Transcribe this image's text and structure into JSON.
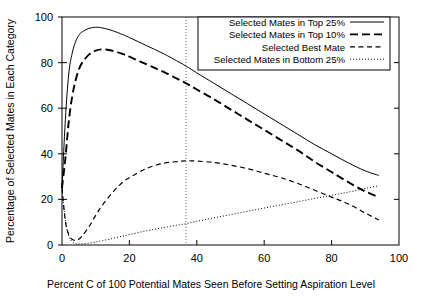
{
  "chart_data": {
    "type": "line",
    "title": "",
    "xlabel": "Percent C of 100 Potential Mates Seen Before Setting Aspiration Level",
    "ylabel": "Percentage of Selected Mates in Each Category",
    "xlim": [
      0,
      100
    ],
    "ylim": [
      0,
      100
    ],
    "xticks": [
      0,
      20,
      40,
      60,
      80,
      100
    ],
    "yticks": [
      0,
      20,
      40,
      60,
      80,
      100
    ],
    "xtick_labels": [
      "0",
      "20",
      "40",
      "60",
      "80",
      "100"
    ],
    "ytick_labels": [
      "0",
      "20",
      "40",
      "60",
      "80",
      "100"
    ],
    "grid": false,
    "legend_position": "top-right",
    "annotations": [
      {
        "name": "optimal-c-line",
        "type": "vline",
        "x": 37,
        "style": "dotted",
        "label": ""
      }
    ],
    "x": [
      0,
      1,
      2,
      3,
      4,
      5,
      6,
      8,
      10,
      12,
      15,
      18,
      20,
      25,
      30,
      35,
      37,
      40,
      45,
      50,
      55,
      60,
      65,
      70,
      75,
      80,
      85,
      90,
      94
    ],
    "series": [
      {
        "name": "Selected Mates in Top 25%",
        "style": "solid",
        "values": [
          25,
          55,
          75,
          84,
          89,
          92,
          93.5,
          95,
          95.5,
          95.2,
          94,
          92.3,
          91,
          87.5,
          84,
          80,
          78.3,
          75.5,
          71,
          66.5,
          62,
          57.5,
          53,
          48.5,
          44,
          40,
          36,
          32.5,
          30.5
        ]
      },
      {
        "name": "Selected Mates in Top 10%",
        "style": "longdash",
        "values": [
          25,
          38,
          54,
          65,
          72,
          77,
          80,
          83.5,
          85.2,
          85.8,
          85.2,
          83.8,
          82.6,
          79.3,
          76,
          72.3,
          70.8,
          68.2,
          64,
          59.5,
          55,
          50.5,
          46,
          41.5,
          36.5,
          32,
          27.5,
          23.5,
          21
        ]
      },
      {
        "name": "Selected Best Mate",
        "style": "dash",
        "values": [
          25,
          10.5,
          4.5,
          2.5,
          2,
          2.5,
          4,
          8,
          13,
          17.5,
          23,
          27.5,
          29.5,
          33.5,
          35.8,
          36.7,
          36.9,
          36.8,
          36.2,
          35,
          33.5,
          31.5,
          29.5,
          27,
          24,
          21,
          18,
          14,
          11
        ]
      },
      {
        "name": "Selected Mates in Bottom 25%",
        "style": "dot",
        "values": [
          24,
          11,
          4,
          1.5,
          0.6,
          0.4,
          0.5,
          0.8,
          1.3,
          1.9,
          2.9,
          3.9,
          4.6,
          6.2,
          7.6,
          8.9,
          9.4,
          10.4,
          11.9,
          13.3,
          14.8,
          16.2,
          17.6,
          19,
          20.4,
          21.8,
          23.2,
          24.8,
          26
        ]
      }
    ]
  },
  "legend": {
    "entries": [
      {
        "label": "Selected Mates in Top 25%",
        "style": "solid"
      },
      {
        "label": "Selected Mates in Top 10%",
        "style": "longdash"
      },
      {
        "label": "Selected Best Mate",
        "style": "dash"
      },
      {
        "label": "Selected Mates in Bottom 25%",
        "style": "dot"
      }
    ]
  },
  "colors": {
    "ink": "#000000",
    "frame": "#1a1a1a",
    "background": "#ffffff",
    "vline": "#555555"
  }
}
